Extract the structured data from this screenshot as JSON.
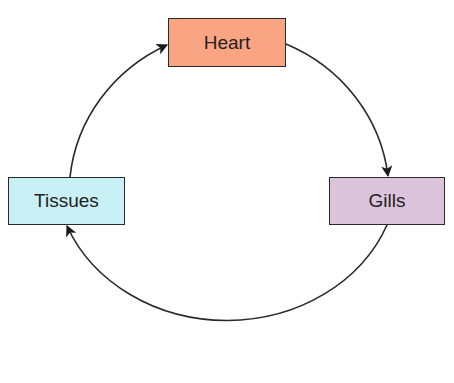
{
  "diagram": {
    "type": "cycle",
    "title": "",
    "nodes": [
      {
        "id": "heart",
        "label": "Heart",
        "color": "#f9a583"
      },
      {
        "id": "gills",
        "label": "Gills",
        "color": "#dcc3dc"
      },
      {
        "id": "tissues",
        "label": "Tissues",
        "color": "#c9f1f5"
      }
    ],
    "edges": [
      {
        "from": "heart",
        "to": "gills"
      },
      {
        "from": "gills",
        "to": "tissues"
      },
      {
        "from": "tissues",
        "to": "heart"
      }
    ],
    "line_color": "#2a2a2a"
  }
}
